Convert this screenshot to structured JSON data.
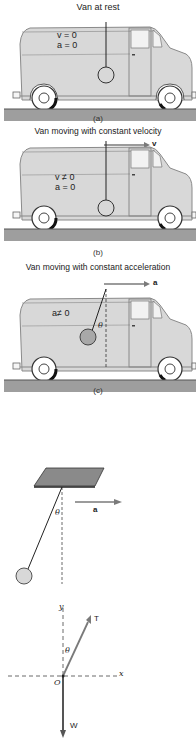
{
  "panels": [
    {
      "id": "a",
      "title": "Van at rest",
      "sub_label": "(a)",
      "equations": [
        "v = 0",
        "a = 0"
      ]
    },
    {
      "id": "b",
      "title": "Van moving with constant velocity",
      "sub_label": "(b)",
      "vector_label": "v",
      "equations": [
        "v ≠ 0",
        "a = 0"
      ]
    },
    {
      "id": "c",
      "title": "Van moving with constant acceleration",
      "sub_label": "(c)",
      "vector_label": "a",
      "equations": [
        "a≠ 0"
      ],
      "angle_label": "θ"
    }
  ],
  "pendulum": {
    "angle_label": "θ",
    "vector_label": "a"
  },
  "free_body": {
    "x_axis": "x",
    "y_axis": "y",
    "origin": "O",
    "tension": "T",
    "weight": "W",
    "angle_label": "θ"
  },
  "colors": {
    "van_body": "#d8d8d8",
    "van_outline": "#8a8a8a",
    "ground": "#9e9e9e",
    "bob_shaded": "#a8a8a8",
    "arrow": "#7a7a7a",
    "ink": "#222222"
  }
}
